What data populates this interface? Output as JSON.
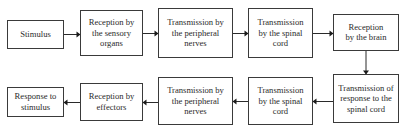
{
  "diagram": {
    "type": "flowchart",
    "nodes": [
      {
        "id": "stimulus",
        "lines": [
          "Stimulus"
        ]
      },
      {
        "id": "reception-sensory",
        "lines": [
          "Reception by",
          "the sensory",
          "organs"
        ]
      },
      {
        "id": "transmission-peripheral-1",
        "lines": [
          "Transmission by",
          "the peripheral",
          "nerves"
        ]
      },
      {
        "id": "transmission-spinal-1",
        "lines": [
          "Transmission",
          "by the spinal",
          "cord"
        ]
      },
      {
        "id": "reception-brain",
        "lines": [
          "Reception",
          "by the brain"
        ]
      },
      {
        "id": "transmission-response-spinal",
        "lines": [
          "Transmission of",
          "response to the",
          "spinal cord"
        ]
      },
      {
        "id": "transmission-spinal-2",
        "lines": [
          "Transmission",
          "by the spinal",
          "cord"
        ]
      },
      {
        "id": "transmission-peripheral-2",
        "lines": [
          "Transmission by",
          "the peripheral",
          "nerves"
        ]
      },
      {
        "id": "reception-effectors",
        "lines": [
          "Reception by",
          "effectors"
        ]
      },
      {
        "id": "response",
        "lines": [
          "Response to",
          "stimulus"
        ]
      }
    ],
    "edges": [
      {
        "from": "stimulus",
        "to": "reception-sensory"
      },
      {
        "from": "reception-sensory",
        "to": "transmission-peripheral-1"
      },
      {
        "from": "transmission-peripheral-1",
        "to": "transmission-spinal-1"
      },
      {
        "from": "transmission-spinal-1",
        "to": "reception-brain"
      },
      {
        "from": "reception-brain",
        "to": "transmission-response-spinal"
      },
      {
        "from": "transmission-response-spinal",
        "to": "transmission-spinal-2"
      },
      {
        "from": "transmission-spinal-2",
        "to": "transmission-peripheral-2"
      },
      {
        "from": "transmission-peripheral-2",
        "to": "reception-effectors"
      },
      {
        "from": "reception-effectors",
        "to": "response"
      }
    ]
  }
}
